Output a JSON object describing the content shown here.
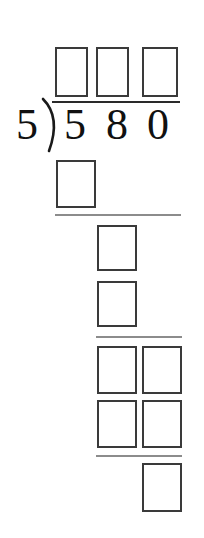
{
  "worksheet": {
    "type": "long-division-problem",
    "title": "Long division problem 580 divided by 5",
    "divisor": "5",
    "dividend": "580",
    "dividend_digits": [
      "5",
      "8",
      "0"
    ],
    "operator_symbol": "long-division-bracket",
    "quotient_blank_count": 3,
    "colors": {
      "box_border": "#3a3a3a",
      "rule": "#8c8c8c",
      "digit": "#111111",
      "background": "#ffffff"
    },
    "quotient_boxes": [
      {
        "label": "quotient-hundreds-blank",
        "value": ""
      },
      {
        "label": "quotient-tens-blank",
        "value": ""
      },
      {
        "label": "quotient-ones-blank",
        "value": ""
      }
    ],
    "work_rows": [
      {
        "label": "first-partial-product",
        "boxes": [
          {
            "label": "first-partial-product-ones-blank",
            "value": ""
          }
        ]
      },
      {
        "label": "first-remainder",
        "boxes": [
          {
            "label": "first-remainder-blank",
            "value": ""
          }
        ]
      },
      {
        "label": "first-bring-down",
        "boxes": [
          {
            "label": "first-bring-down-blank",
            "value": ""
          }
        ]
      },
      {
        "label": "second-partial-product",
        "boxes": [
          {
            "label": "second-partial-product-tens-blank",
            "value": ""
          },
          {
            "label": "second-partial-product-ones-blank",
            "value": ""
          }
        ]
      },
      {
        "label": "second-remainder-bring-down",
        "boxes": [
          {
            "label": "second-remainder-tens-blank",
            "value": ""
          },
          {
            "label": "second-remainder-ones-blank",
            "value": ""
          }
        ]
      },
      {
        "label": "final-remainder",
        "boxes": [
          {
            "label": "final-remainder-blank",
            "value": ""
          }
        ]
      }
    ],
    "separator_rules": [
      {
        "label": "subtraction-rule-1"
      },
      {
        "label": "subtraction-rule-2"
      },
      {
        "label": "subtraction-rule-3"
      }
    ]
  }
}
